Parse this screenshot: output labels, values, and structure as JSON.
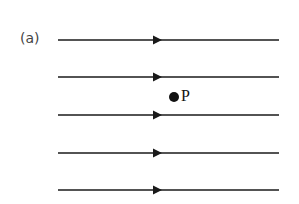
{
  "diagram": {
    "panel_label": "(a)",
    "field_lines": [
      {
        "y": 40,
        "x1": 58,
        "x2": 279,
        "arrow_x": 153,
        "direction": "right"
      },
      {
        "y": 77,
        "x1": 58,
        "x2": 279,
        "arrow_x": 153,
        "direction": "right"
      },
      {
        "y": 115,
        "x1": 58,
        "x2": 279,
        "arrow_x": 153,
        "direction": "right"
      },
      {
        "y": 153,
        "x1": 58,
        "x2": 279,
        "arrow_x": 153,
        "direction": "right"
      },
      {
        "y": 190,
        "x1": 58,
        "x2": 279,
        "arrow_x": 153,
        "direction": "right"
      }
    ],
    "point": {
      "label": "P",
      "x": 174,
      "y": 97
    },
    "colors": {
      "line": "#1a1a1a",
      "background": "#ffffff"
    }
  }
}
